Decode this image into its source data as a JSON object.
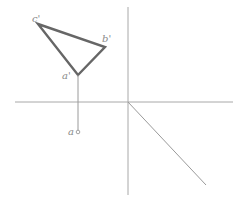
{
  "diagram": {
    "type": "orthographic-projection",
    "colors": {
      "axis": "#a8a8a8",
      "projector": "#9a9a9a",
      "triangle": "#666666",
      "label": "#8a8a8a"
    },
    "axes": {
      "horizontal": {
        "x1": 15,
        "y1": 102,
        "x2": 233,
        "y2": 102
      },
      "vertical": {
        "x1": 128,
        "y1": 7,
        "x2": 128,
        "y2": 195
      },
      "diagonal": {
        "x1": 128,
        "y1": 102,
        "x2": 206,
        "y2": 185
      }
    },
    "triangle": {
      "points": [
        {
          "id": "c'",
          "x": 38,
          "y": 24
        },
        {
          "id": "b'",
          "x": 105,
          "y": 47
        },
        {
          "id": "a'",
          "x": 78,
          "y": 75
        }
      ]
    },
    "projector": {
      "x1": 78,
      "y1": 75,
      "x2": 78,
      "y2": 131
    },
    "point_a": {
      "x": 78,
      "y": 132,
      "r": 1.8
    },
    "labels": {
      "c_prime": "c'",
      "b_prime": "b'",
      "a_prime": "a'",
      "a": "a"
    }
  }
}
